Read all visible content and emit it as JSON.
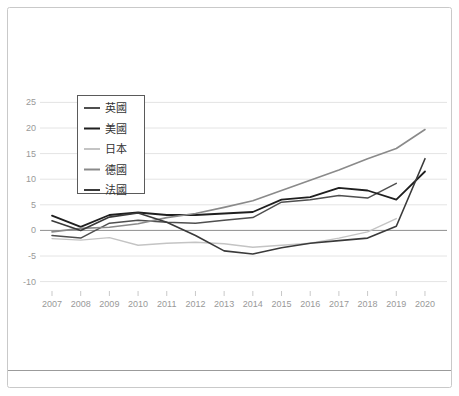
{
  "panel": {
    "background": "#ffffff",
    "border_color": "#c9c9c9",
    "divider_color": "#9b9b9b"
  },
  "chart_data": {
    "type": "line",
    "title": "",
    "xlabel": "",
    "ylabel": "",
    "x": [
      "2007",
      "2008",
      "2009",
      "2010",
      "2011",
      "2012",
      "2013",
      "2014",
      "2015",
      "2016",
      "2017",
      "2018",
      "2019",
      "2020"
    ],
    "series": [
      {
        "name": "英國",
        "color": "#4f4f4f",
        "width": 1.5,
        "values": [
          -1.0,
          -1.5,
          1.4,
          2.0,
          1.6,
          1.4,
          2.0,
          2.5,
          5.5,
          6.0,
          6.8,
          6.3,
          9.2,
          null
        ]
      },
      {
        "name": "美國",
        "color": "#1f1f1f",
        "width": 1.8,
        "values": [
          2.9,
          0.7,
          3.0,
          3.5,
          3.0,
          3.0,
          3.3,
          3.6,
          6.0,
          6.5,
          8.3,
          7.8,
          6.0,
          11.5
        ]
      },
      {
        "name": "日本",
        "color": "#c4c4c4",
        "width": 1.4,
        "values": [
          -1.6,
          -1.9,
          -1.4,
          -2.9,
          -2.5,
          -2.3,
          -2.6,
          -3.3,
          -2.9,
          -2.5,
          -1.5,
          -0.3,
          2.3,
          null
        ]
      },
      {
        "name": "德國",
        "color": "#8a8a8a",
        "width": 1.6,
        "values": [
          -0.3,
          0.4,
          0.6,
          1.3,
          2.5,
          3.3,
          4.5,
          5.8,
          7.8,
          9.8,
          11.8,
          14.0,
          16.0,
          19.7
        ]
      },
      {
        "name": "法國",
        "color": "#3a3a3a",
        "width": 1.6,
        "values": [
          1.9,
          0.0,
          2.6,
          3.4,
          1.6,
          -1.0,
          -4.0,
          -4.6,
          -3.4,
          -2.5,
          -2.0,
          -1.5,
          0.8,
          14.0
        ]
      }
    ],
    "ylim": [
      -10,
      25
    ],
    "yticks": [
      25,
      20,
      15,
      10,
      5,
      0,
      -5,
      -10
    ],
    "grid": true,
    "zero_line": true,
    "legend_position": "upper-left",
    "axis_label_color": "#999999",
    "gridline_color": "#e4e4e4",
    "zero_line_color": "#8f8f8f",
    "tick_color": "#c9c9c9",
    "legend_text_color": "#333333",
    "legend_border_color": "#5a5a5a",
    "legend_background": "#ffffff"
  }
}
